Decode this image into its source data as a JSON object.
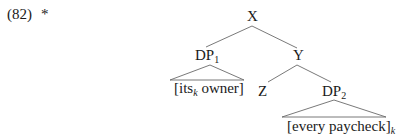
{
  "example": {
    "number": "(82)",
    "judgment": "*"
  },
  "tree": {
    "root": {
      "label": "X"
    },
    "dp1": {
      "label": "DP",
      "subscript": "1",
      "content": {
        "open": "[its",
        "index": "k",
        "rest": " owner]"
      }
    },
    "y": {
      "label": "Y"
    },
    "z": {
      "label": "Z"
    },
    "dp2": {
      "label": "DP",
      "subscript": "2",
      "content": {
        "text": "[every paycheck]",
        "index": "k"
      }
    }
  },
  "colors": {
    "line": "#6a6a6a",
    "text": "#1a1a1a"
  }
}
